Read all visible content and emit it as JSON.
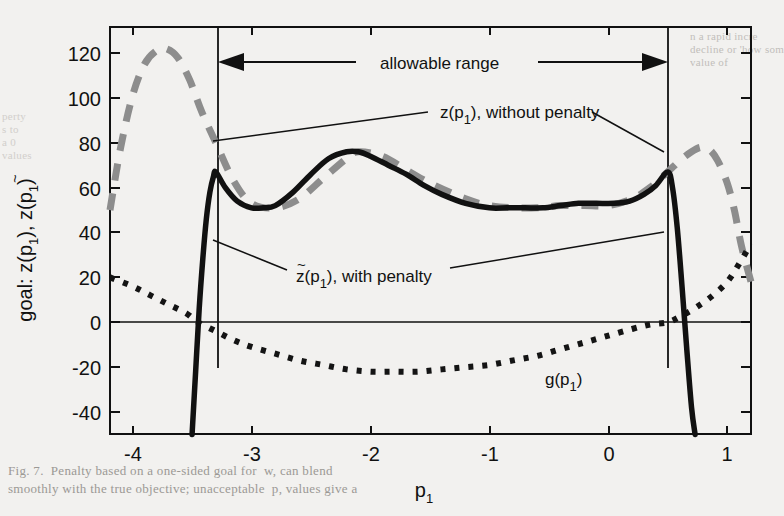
{
  "figure": {
    "axis_labels": {
      "y_prefix": "goal:",
      "y_title": "z(p",
      "y_title_sub1": "1",
      "y_title_mid": "), z",
      "y_title_tilde": "~",
      "y_title_mid2": "(p",
      "y_title_sub2": "1",
      "y_title_end": ")",
      "y_full": "goal:  z(p1), z̃(p1)",
      "x_title": "p",
      "x_title_sub": "1",
      "x_full": "p1"
    },
    "annotations": [
      {
        "id": "allowable-range",
        "text": "allowable range",
        "x": 500,
        "y": 62
      },
      {
        "id": "z-without-penalty",
        "text": "z(p",
        "sub": "1",
        "tail": "), without penalty",
        "x": 443,
        "y": 111
      },
      {
        "id": "z-tilde-with-penalty",
        "text": "z",
        "tilde": "~",
        "open": "(p",
        "sub": "1",
        "tail": "), with penalty",
        "x": 296,
        "y": 276
      },
      {
        "id": "g-curve-label",
        "text": "g(p",
        "sub": "1",
        "tail": ")",
        "x": 545,
        "y": 378
      }
    ],
    "bleed_text": {
      "top_right_lines": [
        "n a rapid incre",
        "decline or 'how som",
        "value of"
      ],
      "left_lines": [
        "perty",
        "s to",
        "a 0",
        "values"
      ],
      "caption_lines": [
        "Fig. 7.  Penalty based on a one-sided goal for  w, can blend",
        "smoothly with the true objective; unacceptable  p, values give a"
      ]
    }
  },
  "chart_data": {
    "type": "line",
    "title": "",
    "xlabel": "p1",
    "ylabel": "goal: z(p1), z̃(p1)",
    "xlim": [
      -4.19,
      1.2
    ],
    "ylim": [
      -49.8,
      131.6
    ],
    "xticks": [
      -4,
      -3,
      -2,
      -1,
      0,
      1
    ],
    "xticklabels": [
      "-4",
      "-3",
      "-2",
      "-1",
      "0",
      "1"
    ],
    "yticks": [
      -40,
      -20,
      0,
      20,
      40,
      60,
      80,
      100,
      120
    ],
    "yticklabels": [
      "-40",
      "-20",
      "0",
      "20",
      "40",
      "60",
      "80",
      "100",
      "120"
    ],
    "grid": false,
    "legend": "none",
    "zero_line": {
      "y": 0,
      "style": "solid-thin"
    },
    "vertical_markers": [
      {
        "label": "lower bound of allowable range",
        "x": -3.3
      },
      {
        "label": "upper bound of allowable range",
        "x": 0.5
      }
    ],
    "series": [
      {
        "name": "z(p1), without penalty",
        "style": "dashed",
        "color": "#888888",
        "linewidth": 6,
        "x": [
          -4.19,
          -4.1,
          -4.0,
          -3.9,
          -3.8,
          -3.72,
          -3.62,
          -3.52,
          -3.42,
          -3.3,
          -3.15,
          -3.0,
          -2.8,
          -2.6,
          -2.4,
          -2.2,
          -2.1,
          -1.9,
          -1.7,
          -1.5,
          -1.2,
          -1.0,
          -0.8,
          -0.6,
          -0.4,
          -0.2,
          0.0,
          0.2,
          0.35,
          0.5,
          0.6,
          0.7,
          0.78,
          0.85,
          0.92,
          1.0,
          1.06,
          1.12,
          1.2
        ],
        "y": [
          50,
          78,
          101,
          115,
          121,
          122,
          118,
          108,
          94,
          80,
          63,
          53,
          51,
          55,
          64,
          73,
          76,
          74,
          68,
          62,
          55,
          52,
          51,
          51,
          52,
          52,
          52,
          55,
          60,
          67,
          72,
          76,
          78,
          77,
          72,
          62,
          50,
          34,
          18
        ]
      },
      {
        "name": "z̃(p1), with penalty",
        "style": "solid",
        "color": "#111111",
        "linewidth": 5,
        "x": [
          -3.5,
          -3.47,
          -3.44,
          -3.41,
          -3.38,
          -3.35,
          -3.32,
          -3.3,
          -3.22,
          -3.12,
          -3.0,
          -2.9,
          -2.8,
          -2.65,
          -2.5,
          -2.35,
          -2.2,
          -2.1,
          -2.0,
          -1.85,
          -1.7,
          -1.55,
          -1.4,
          -1.2,
          -1.0,
          -0.85,
          -0.7,
          -0.55,
          -0.4,
          -0.25,
          -0.1,
          0.05,
          0.18,
          0.3,
          0.4,
          0.5,
          0.54,
          0.58,
          0.62,
          0.66,
          0.7,
          0.73
        ],
        "y": [
          -50,
          -22,
          6,
          28,
          46,
          58,
          65,
          67,
          60,
          54,
          51,
          51,
          52,
          58,
          66,
          73,
          76,
          76,
          74,
          70,
          66,
          61,
          57,
          53,
          51,
          51,
          51,
          51,
          52,
          53,
          53,
          53,
          54,
          57,
          61,
          67,
          60,
          42,
          16,
          -12,
          -38,
          -50
        ]
      },
      {
        "name": "g(p1)",
        "style": "dotted",
        "color": "#111111",
        "linewidth": 5,
        "x": [
          -4.19,
          -4.0,
          -3.85,
          -3.7,
          -3.55,
          -3.45,
          -3.3,
          -3.15,
          -3.0,
          -2.8,
          -2.6,
          -2.4,
          -2.2,
          -2.0,
          -1.8,
          -1.6,
          -1.4,
          -1.2,
          -1.0,
          -0.8,
          -0.6,
          -0.4,
          -0.2,
          0.0,
          0.2,
          0.35,
          0.5,
          0.62,
          0.75,
          0.88,
          1.0,
          1.1,
          1.2
        ],
        "y": [
          20,
          16,
          12,
          8,
          4,
          0,
          -4,
          -8,
          -11,
          -14,
          -17,
          -19,
          -21,
          -22,
          -22,
          -22,
          -21,
          -20,
          -19,
          -17,
          -15,
          -12,
          -9,
          -6,
          -3,
          -1,
          0,
          3,
          7,
          12,
          18,
          26,
          35
        ]
      }
    ]
  }
}
